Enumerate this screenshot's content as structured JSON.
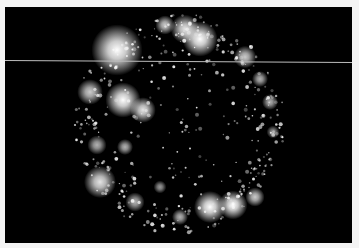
{
  "image": {
    "subject": "fluorescence micrograph of a round nucleus with bright punctate foci arranged around its periphery",
    "background_color": "#000000",
    "border_color": "#f4f4f4",
    "annotation_line_color": "#bdbdbd",
    "clusters": [
      {
        "cx": 112,
        "cy": 43,
        "r": 16,
        "i": 1.0
      },
      {
        "cx": 180,
        "cy": 22,
        "r": 9,
        "i": 0.9
      },
      {
        "cx": 195,
        "cy": 32,
        "r": 11,
        "i": 1.0
      },
      {
        "cx": 160,
        "cy": 18,
        "r": 6,
        "i": 0.8
      },
      {
        "cx": 240,
        "cy": 50,
        "r": 7,
        "i": 0.8
      },
      {
        "cx": 85,
        "cy": 85,
        "r": 8,
        "i": 0.8
      },
      {
        "cx": 118,
        "cy": 93,
        "r": 11,
        "i": 1.0
      },
      {
        "cx": 138,
        "cy": 103,
        "r": 8,
        "i": 0.9
      },
      {
        "cx": 92,
        "cy": 138,
        "r": 6,
        "i": 0.7
      },
      {
        "cx": 120,
        "cy": 140,
        "r": 5,
        "i": 0.7
      },
      {
        "cx": 95,
        "cy": 175,
        "r": 10,
        "i": 0.9
      },
      {
        "cx": 130,
        "cy": 195,
        "r": 6,
        "i": 0.7
      },
      {
        "cx": 205,
        "cy": 200,
        "r": 10,
        "i": 1.0
      },
      {
        "cx": 228,
        "cy": 198,
        "r": 9,
        "i": 1.0
      },
      {
        "cx": 250,
        "cy": 190,
        "r": 6,
        "i": 0.8
      },
      {
        "cx": 265,
        "cy": 95,
        "r": 5,
        "i": 0.7
      },
      {
        "cx": 268,
        "cy": 125,
        "r": 4,
        "i": 0.6
      },
      {
        "cx": 175,
        "cy": 210,
        "r": 5,
        "i": 0.7
      },
      {
        "cx": 155,
        "cy": 180,
        "r": 4,
        "i": 0.6
      },
      {
        "cx": 255,
        "cy": 72,
        "r": 5,
        "i": 0.7
      }
    ]
  }
}
